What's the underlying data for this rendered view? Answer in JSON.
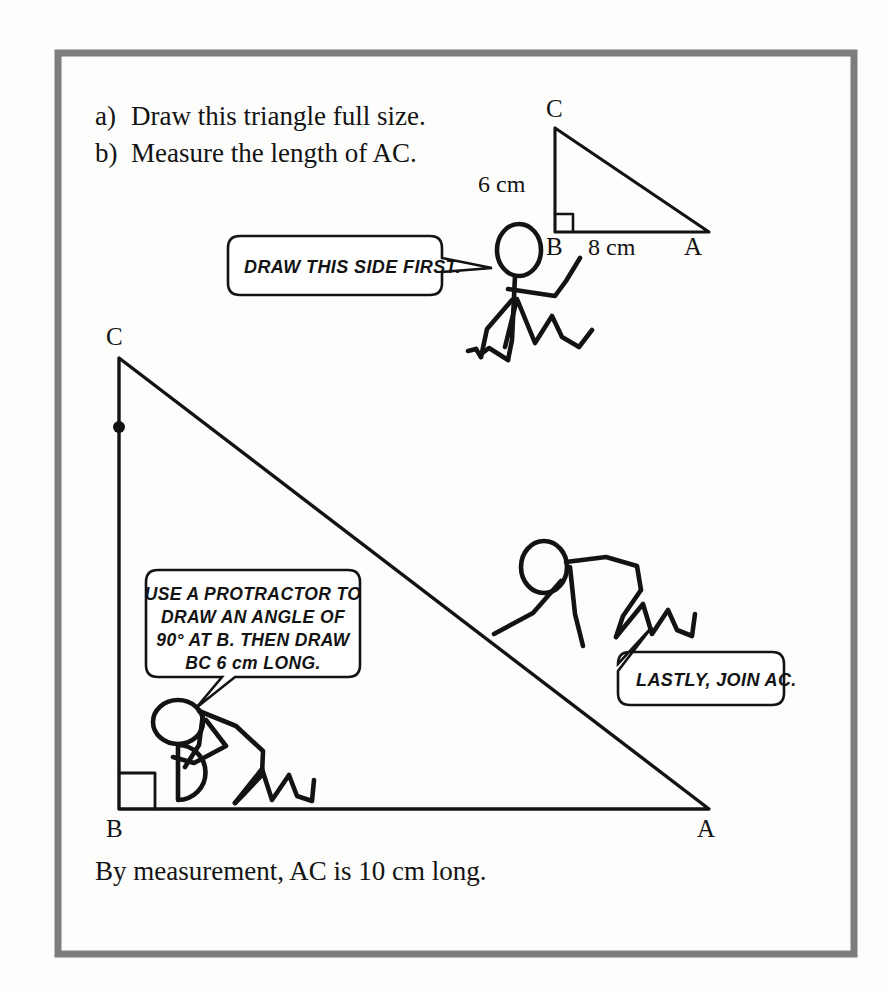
{
  "page": {
    "background_color": "#fdfdfc",
    "ink_color": "#131313",
    "border_color": "#7d7d7d"
  },
  "tasks": [
    {
      "marker": "a)",
      "text": "Draw this triangle full size."
    },
    {
      "marker": "b)",
      "text": "Measure the length of AC."
    }
  ],
  "small_triangle": {
    "vertices": {
      "C": "C",
      "B": "B",
      "A": "A"
    },
    "side_vertical_label": "6 cm",
    "side_base_label": "8 cm",
    "right_angle_at": "B"
  },
  "large_triangle": {
    "vertices": {
      "C": "C",
      "B": "B",
      "A": "A"
    },
    "right_angle_at": "B"
  },
  "speech_bubbles": [
    {
      "name": "draw-side-first",
      "lines": [
        "DRAW THIS SIDE FIRST."
      ]
    },
    {
      "name": "use-protractor",
      "lines": [
        "USE A PROTRACTOR TO",
        "DRAW AN ANGLE OF",
        "90° AT B. THEN DRAW",
        "BC 6 cm LONG."
      ]
    },
    {
      "name": "lastly-join-ac",
      "lines": [
        "LASTLY, JOIN AC."
      ]
    }
  ],
  "caption": "By measurement, AC is 10 cm long."
}
